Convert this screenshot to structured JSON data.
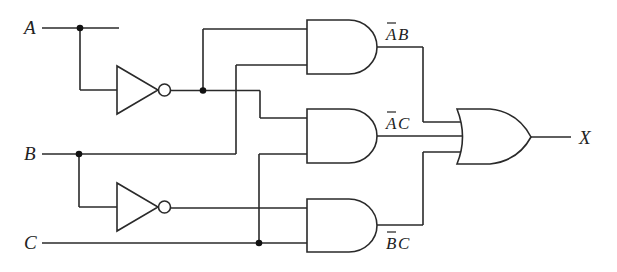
{
  "diagram": {
    "type": "logic-circuit",
    "inputs": [
      {
        "label": "A"
      },
      {
        "label": "B"
      },
      {
        "label": "C"
      }
    ],
    "output": {
      "label": "X"
    },
    "gates": [
      {
        "id": "not_a",
        "type": "NOT",
        "input": "A"
      },
      {
        "id": "not_b",
        "type": "NOT",
        "input": "B"
      },
      {
        "id": "and1",
        "type": "AND",
        "inputs": [
          "A'",
          "B"
        ],
        "term": {
          "text": "AB",
          "overbar": "A"
        }
      },
      {
        "id": "and2",
        "type": "AND",
        "inputs": [
          "A'",
          "C"
        ],
        "term": {
          "text": "AC",
          "overbar": "A"
        }
      },
      {
        "id": "and3",
        "type": "AND",
        "inputs": [
          "B'",
          "C"
        ],
        "term": {
          "text": "BC",
          "overbar": "B"
        }
      },
      {
        "id": "or1",
        "type": "OR",
        "inputs": [
          "and1",
          "and2",
          "and3"
        ],
        "output": "X"
      }
    ],
    "terms": {
      "t1_first": "A",
      "t1_second": "B",
      "t2_first": "A",
      "t2_second": "C",
      "t3_first": "B",
      "t3_second": "C"
    },
    "colors": {
      "line": "#2a2a2a",
      "background": "#ffffff"
    }
  }
}
